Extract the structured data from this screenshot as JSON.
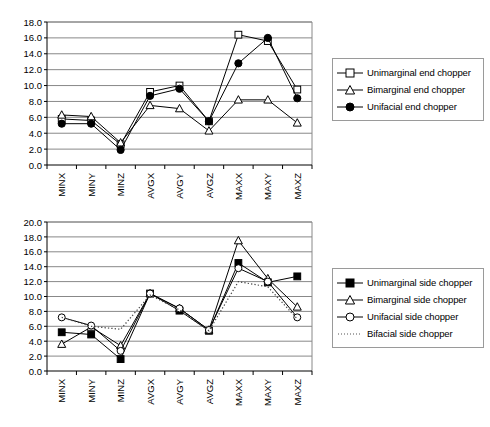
{
  "figure": {
    "background": "#ffffff",
    "axis_color": "#000000",
    "gridline_color": "#808080",
    "series_color": "#000000"
  },
  "chart_data": [
    {
      "id": "end-chopper-chart",
      "type": "line",
      "title": "",
      "xlabel": "",
      "ylabel": "",
      "ylim": [
        0.0,
        18.0
      ],
      "ytick_step": 2.0,
      "yticks": [
        "0.0",
        "2.0",
        "4.0",
        "6.0",
        "8.0",
        "10.0",
        "12.0",
        "14.0",
        "16.0",
        "18.0"
      ],
      "grid": true,
      "grid_axis": "y",
      "legend_position": "right",
      "categories": [
        "MINX",
        "MINY",
        "MINZ",
        "AVGX",
        "AVGY",
        "AVGZ",
        "MAXX",
        "MAXY",
        "MAXZ"
      ],
      "series": [
        {
          "name": "Unimarginal end chopper",
          "marker": "open-square",
          "linestyle": "solid",
          "values": [
            5.8,
            5.6,
            2.6,
            9.2,
            10.0,
            5.5,
            16.4,
            15.6,
            9.5
          ]
        },
        {
          "name": "Bimarginal end chopper",
          "marker": "open-triangle",
          "linestyle": "solid",
          "values": [
            6.3,
            6.1,
            2.8,
            7.5,
            7.1,
            4.3,
            8.2,
            8.2,
            5.3
          ]
        },
        {
          "name": "Unifacial end chopper",
          "marker": "filled-circle",
          "linestyle": "solid",
          "values": [
            5.2,
            5.2,
            1.9,
            8.7,
            9.6,
            5.5,
            12.8,
            16.0,
            8.4
          ]
        }
      ]
    },
    {
      "id": "side-chopper-chart",
      "type": "line",
      "title": "",
      "xlabel": "",
      "ylabel": "",
      "ylim": [
        0.0,
        20.0
      ],
      "ytick_step": 2.0,
      "yticks": [
        "0.0",
        "2.0",
        "4.0",
        "6.0",
        "8.0",
        "10.0",
        "12.0",
        "14.0",
        "16.0",
        "18.0",
        "20.0"
      ],
      "grid": true,
      "grid_axis": "y",
      "legend_position": "right",
      "categories": [
        "MINX",
        "MINY",
        "MINZ",
        "AVGX",
        "AVGY",
        "AVGZ",
        "MAXX",
        "MAXY",
        "MAXZ"
      ],
      "series": [
        {
          "name": "Unimarginal side chopper",
          "marker": "filled-square",
          "linestyle": "solid",
          "values": [
            5.2,
            4.9,
            1.6,
            10.4,
            8.1,
            5.4,
            14.5,
            11.9,
            12.7
          ]
        },
        {
          "name": "Bimarginal side chopper",
          "marker": "open-triangle",
          "linestyle": "solid",
          "values": [
            3.6,
            5.9,
            3.4,
            10.4,
            8.4,
            5.5,
            17.5,
            12.4,
            8.6
          ]
        },
        {
          "name": "Unifacial side chopper",
          "marker": "open-circle",
          "linestyle": "solid",
          "values": [
            7.2,
            6.1,
            2.7,
            10.4,
            8.4,
            5.5,
            13.8,
            12.0,
            7.2
          ]
        },
        {
          "name": "Bifacial side chopper",
          "marker": "none",
          "linestyle": "dotted",
          "values": [
            7.2,
            6.0,
            5.6,
            10.2,
            8.2,
            5.4,
            12.0,
            11.3,
            7.0
          ]
        }
      ]
    }
  ]
}
